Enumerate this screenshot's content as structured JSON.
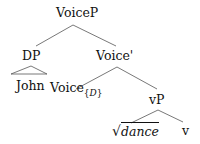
{
  "tree": {
    "root": "VoiceP",
    "nodes": {
      "voicep": "VoiceP",
      "dp": "DP",
      "john": "John",
      "voice_bar": "Voice'",
      "voice_head": "Voice",
      "voice_sub_open": "{",
      "voice_sub": "D",
      "voice_sub_close": "}",
      "vp": "vP",
      "root_sign": "√",
      "dance": "dance",
      "v": "v"
    },
    "structure": [
      {
        "parent": "VoiceP",
        "children": [
          "DP",
          "Voice'"
        ]
      },
      {
        "parent": "DP",
        "children": [
          "John"
        ],
        "triangle": true
      },
      {
        "parent": "Voice'",
        "children": [
          "Voice{D}",
          "vP"
        ]
      },
      {
        "parent": "vP",
        "children": [
          "√dance",
          "v"
        ]
      }
    ],
    "line_color": "#555555"
  }
}
